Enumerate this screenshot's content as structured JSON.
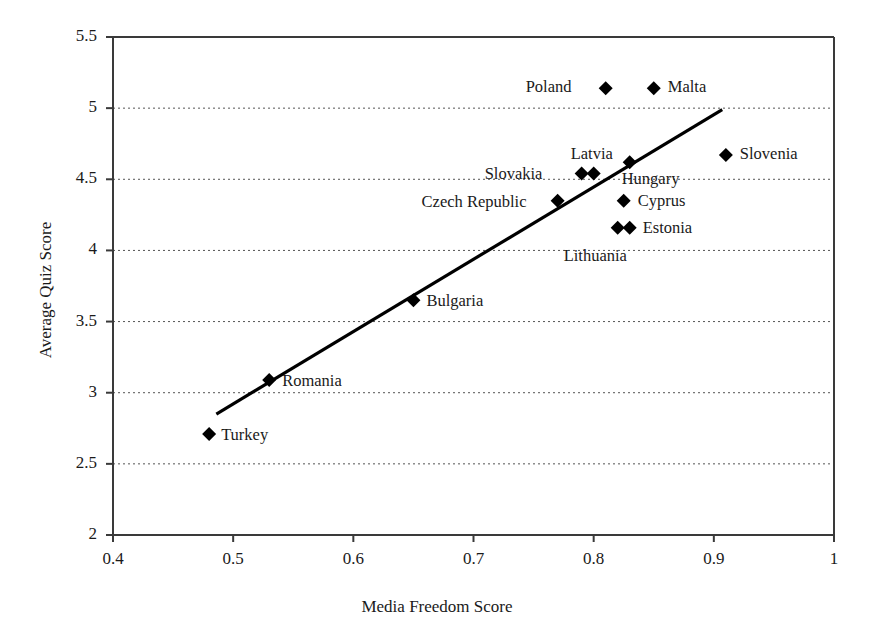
{
  "chart_data": {
    "type": "scatter",
    "title": "",
    "xlabel": "Media Freedom Score",
    "ylabel": "Average Quiz Score",
    "xlim": [
      0.4,
      1
    ],
    "ylim": [
      2,
      5.5
    ],
    "xticks": [
      "0.4",
      "0.5",
      "0.6",
      "0.7",
      "0.8",
      "0.9",
      "1"
    ],
    "xtick_values": [
      0.4,
      0.5,
      0.6,
      0.7,
      0.8,
      0.9,
      1
    ],
    "yticks": [
      "2",
      "2.5",
      "3",
      "3.5",
      "4",
      "4.5",
      "5",
      "5.5"
    ],
    "ytick_values": [
      2,
      2.5,
      3,
      3.5,
      4,
      4.5,
      5,
      5.5
    ],
    "grid": "horizontal-dotted",
    "legend": "none",
    "marker": "filled-diamond",
    "marker_color": "#000000",
    "points": [
      {
        "label": "Turkey",
        "x": 0.48,
        "y": 2.71,
        "label_dx": 12,
        "label_dy": -9
      },
      {
        "label": "Romania",
        "x": 0.53,
        "y": 3.09,
        "label_dx": 13,
        "label_dy": -9
      },
      {
        "label": "Bulgaria",
        "x": 0.65,
        "y": 3.65,
        "label_dx": 13,
        "label_dy": -9
      },
      {
        "label": "Czech Republic",
        "x": 0.77,
        "y": 4.35,
        "label_dx": -136,
        "label_dy": -9
      },
      {
        "label": "Slovakia",
        "x": 0.79,
        "y": 4.54,
        "label_dx": -97,
        "label_dy": -10
      },
      {
        "label": "Latvia",
        "x": 0.8,
        "y": 4.54,
        "label_dx": -23,
        "label_dy": -30
      },
      {
        "label": "Hungary",
        "x": 0.83,
        "y": 4.62,
        "label_dx": -8,
        "label_dy": 7
      },
      {
        "label": "Cyprus",
        "x": 0.825,
        "y": 4.35,
        "label_dx": 14,
        "label_dy": -10
      },
      {
        "label": "Estonia",
        "x": 0.82,
        "y": 4.16,
        "label_dx": 25,
        "label_dy": -10
      },
      {
        "label": "Lithuania",
        "x": 0.83,
        "y": 4.16,
        "label_dx": -66,
        "label_dy": 18
      },
      {
        "label": "Poland",
        "x": 0.81,
        "y": 5.14,
        "label_dx": -80,
        "label_dy": -11
      },
      {
        "label": "Malta",
        "x": 0.85,
        "y": 5.14,
        "label_dx": 14,
        "label_dy": -11
      },
      {
        "label": "Slovenia",
        "x": 0.91,
        "y": 4.67,
        "label_dx": 14,
        "label_dy": -11
      }
    ],
    "trendline": {
      "type": "linear-fit",
      "x_start": 0.486,
      "y_start": 2.85,
      "x_end": 0.907,
      "y_end": 4.99
    }
  }
}
